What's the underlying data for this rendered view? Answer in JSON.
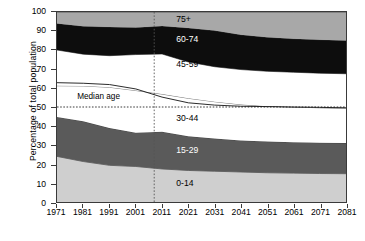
{
  "chart_data": {
    "type": "area",
    "title": "",
    "xlabel": "",
    "ylabel": "Percentage of total population",
    "stacked": true,
    "xlim": [
      1971,
      2081
    ],
    "ylim": [
      0,
      100
    ],
    "grid": false,
    "legend_position": "inline",
    "x": [
      1971,
      1981,
      1991,
      2001,
      2011,
      2021,
      2031,
      2041,
      2051,
      2061,
      2071,
      2081
    ],
    "xticklabels": [
      "1971",
      "1981",
      "1991",
      "2001",
      "2011",
      "2021",
      "2031",
      "2041",
      "2051",
      "2061",
      "2071",
      "2081"
    ],
    "yticklabels": [
      "0",
      "10",
      "20",
      "30",
      "40",
      "50",
      "60",
      "70",
      "80",
      "90",
      "100"
    ],
    "yticks": [
      0,
      10,
      20,
      30,
      40,
      50,
      60,
      70,
      80,
      90,
      100
    ],
    "series": [
      {
        "name": "0-14",
        "color": "#cfcfcf",
        "label_color": "#000000",
        "values": [
          24.0,
          21.3,
          19.3,
          18.7,
          17.4,
          16.6,
          16.2,
          15.8,
          15.4,
          15.2,
          15.0,
          14.9
        ]
      },
      {
        "name": "15-29",
        "color": "#5a5a5a",
        "label_color": "#ffffff",
        "values": [
          20.8,
          21.2,
          19.6,
          17.8,
          19.6,
          18.0,
          17.2,
          16.6,
          16.4,
          16.3,
          16.2,
          16.1
        ]
      },
      {
        "name": "30-44",
        "color": "#ffffff",
        "label_color": "#000000",
        "values": [
          16.4,
          18.6,
          21.5,
          22.2,
          19.8,
          20.0,
          19.4,
          18.9,
          18.6,
          18.5,
          18.4,
          18.3
        ]
      },
      {
        "name": "45-59",
        "color": "#ffffff",
        "label_color": "#000000",
        "values": [
          18.8,
          16.7,
          16.6,
          18.9,
          21.1,
          19.1,
          18.4,
          18.4,
          18.4,
          18.3,
          18.2,
          18.2
        ]
      },
      {
        "name": "60-74",
        "color": "#0d0d0d",
        "label_color": "#ffffff",
        "values": [
          14.0,
          14.7,
          15.1,
          14.2,
          14.7,
          17.9,
          19.0,
          18.3,
          17.9,
          17.6,
          17.6,
          17.5
        ]
      },
      {
        "name": "75+",
        "color": "#a8a8a8",
        "label_color": "#000000",
        "values": [
          6.0,
          7.5,
          7.9,
          8.2,
          7.4,
          8.4,
          9.8,
          12.0,
          13.3,
          14.1,
          14.6,
          15.0
        ]
      }
    ],
    "median_age_line": {
      "name": "Median age",
      "label": "Median age",
      "values": [
        62.8,
        62.5,
        61.8,
        59.5,
        55.2,
        52.2,
        51.0,
        50.4,
        50.2,
        50.0,
        49.8,
        49.6
      ]
    },
    "reference_lines": {
      "horizontal_dotted_y": 50,
      "vertical_dotted_x": 2008
    },
    "band_labels": [
      {
        "text": "75+",
        "x": 2021,
        "y": 95.5,
        "on_dark": false
      },
      {
        "text": "60-74",
        "x": 2021,
        "y": 85.0,
        "on_dark": true
      },
      {
        "text": "45-59",
        "x": 2021,
        "y": 72.0,
        "on_dark": false
      },
      {
        "text": "30-44",
        "x": 2021,
        "y": 44.0,
        "on_dark": false
      },
      {
        "text": "15-29",
        "x": 2021,
        "y": 27.0,
        "on_dark": true
      },
      {
        "text": "0-14",
        "x": 2021,
        "y": 10.0,
        "on_dark": false
      }
    ],
    "median_label": {
      "text": "Median age",
      "x": 1979,
      "y": 54.5
    }
  }
}
